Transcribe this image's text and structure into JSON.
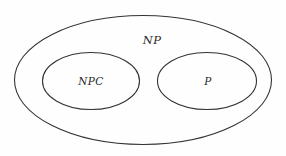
{
  "diagram": {
    "type": "euler-venn",
    "title_text": "",
    "background_color": "#fefefe",
    "stroke_color": "#333333",
    "label_color": "#2b2b2b",
    "fill_color": "none",
    "stroke_width": 1,
    "sets": [
      {
        "id": "np",
        "label": "NP",
        "role": "outer-set",
        "cx": 143,
        "cy": 80,
        "rx": 129,
        "ry": 65,
        "label_x": 152,
        "label_y": 40
      },
      {
        "id": "npc",
        "label": "NPC",
        "role": "inner-set-left",
        "cx": 91,
        "cy": 81,
        "rx": 49,
        "ry": 29,
        "label_x": 91,
        "label_y": 81
      },
      {
        "id": "p",
        "label": "P",
        "role": "inner-set-right",
        "cx": 207,
        "cy": 81,
        "rx": 50,
        "ry": 29,
        "label_x": 208,
        "label_y": 81
      }
    ]
  }
}
